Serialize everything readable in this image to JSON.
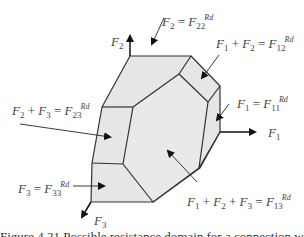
{
  "diagram": {
    "type": "interaction-polyhedron",
    "axes": [
      {
        "id": "F1",
        "label": "F",
        "sub": "1"
      },
      {
        "id": "F2",
        "label": "F",
        "sub": "2"
      },
      {
        "id": "F3",
        "label": "F",
        "sub": "3"
      }
    ],
    "labels": {
      "f22": {
        "lhs": "F",
        "lhs_sub": "2",
        "eq": " = ",
        "rhs": "F",
        "rhs_sub": "22",
        "sup": "Rd"
      },
      "f12": {
        "a": "F",
        "a_sub": "1",
        "plus": " + ",
        "b": "F",
        "b_sub": "2",
        "eq": " = ",
        "rhs": "F",
        "rhs_sub": "12",
        "sup": "Rd"
      },
      "f11": {
        "lhs": "F",
        "lhs_sub": "1",
        "eq": " = ",
        "rhs": "F",
        "rhs_sub": "11",
        "sup": "Rd"
      },
      "f23": {
        "a": "F",
        "a_sub": "2",
        "plus": " + ",
        "b": "F",
        "b_sub": "3",
        "eq": " = ",
        "rhs": "F",
        "rhs_sub": "23",
        "sup": "Rd"
      },
      "f33": {
        "lhs": "F",
        "lhs_sub": "3",
        "eq": " = ",
        "rhs": "F",
        "rhs_sub": "33",
        "sup": "Rd"
      },
      "f13": {
        "a": "F",
        "a_sub": "1",
        "plus": " + ",
        "b": "F",
        "b_sub": "2",
        "plus2": " + ",
        "c": "F",
        "c_sub": "3",
        "eq": " = ",
        "rhs": "F",
        "rhs_sub": "13",
        "sup": "Rd"
      }
    },
    "colors": {
      "face_fill": "#e6e6e6",
      "edge": "#333333",
      "text": "#444444"
    },
    "caption": "Figure 4.21   Possible resistance domain for a connection with three bolt-rows"
  }
}
